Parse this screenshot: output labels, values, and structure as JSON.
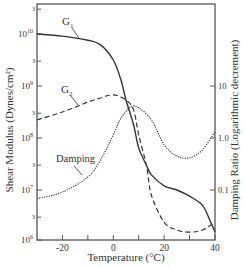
{
  "chart_data": {
    "type": "line",
    "title": "",
    "xlabel": "Temperature (°C)",
    "ylabel": "Shear Modulus (Dynes/cm²)",
    "ylabel_right": "Damping Ratio (Logarithmic decrement)",
    "xlim": [
      -30,
      40
    ],
    "ylim": [
      1000000.0,
      30000000000.0
    ],
    "ylim_right": [
      0.01,
      30
    ],
    "yscale": "log",
    "grid": false,
    "legend": "inline annotations",
    "x_ticks": [
      {
        "value": -20,
        "label": "-20"
      },
      {
        "value": 0,
        "label": "0"
      },
      {
        "value": 20,
        "label": "20"
      },
      {
        "value": 40,
        "label": "40"
      }
    ],
    "x_minor_ticks": [
      -10,
      10,
      30
    ],
    "y_ticks_left": [
      {
        "exp": 10,
        "label_base": "10",
        "label_exp": "10"
      },
      {
        "exp": 9,
        "label_base": "10",
        "label_exp": "9"
      },
      {
        "exp": 8,
        "label_base": "10",
        "label_exp": "8"
      },
      {
        "exp": 7,
        "label_base": "10",
        "label_exp": "7"
      },
      {
        "exp": 6,
        "label_base": "10",
        "label_exp": "6"
      }
    ],
    "y_minor_ticks_left": [
      {
        "exp": 10.477,
        "label": "3"
      },
      {
        "exp": 9.477,
        "label": "3"
      },
      {
        "exp": 8.477,
        "label": "3"
      },
      {
        "exp": 7.477,
        "label": "3"
      },
      {
        "exp": 6.477,
        "label": "3"
      }
    ],
    "y_ticks_right": [
      {
        "value": 10,
        "label": "10"
      },
      {
        "value": 1.0,
        "label": "1.0"
      },
      {
        "value": 0.1,
        "label": "0.1"
      }
    ],
    "series": [
      {
        "name": "G1",
        "label_main": "G",
        "label_sub": "1",
        "axis": "left",
        "style": "solid",
        "x": [
          -30,
          -20,
          -10,
          -5,
          0,
          3,
          5,
          8,
          10,
          13,
          15,
          20,
          25,
          30,
          35,
          38,
          40
        ],
        "log10_values": [
          10.0,
          9.96,
          9.88,
          9.79,
          9.5,
          9.12,
          8.73,
          8.25,
          7.81,
          7.48,
          7.29,
          7.08,
          7.0,
          6.88,
          6.71,
          6.42,
          6.19
        ]
      },
      {
        "name": "G2",
        "label_main": "G",
        "label_sub": "2",
        "axis": "left",
        "style": "dashed",
        "x": [
          -30,
          -20,
          -10,
          -5,
          0,
          5,
          8,
          10,
          13,
          15,
          20,
          25,
          30,
          35,
          40
        ],
        "log10_values": [
          8.35,
          8.5,
          8.69,
          8.77,
          8.83,
          8.73,
          8.54,
          8.06,
          7.48,
          6.9,
          6.38,
          6.23,
          6.19,
          6.23,
          6.38
        ]
      },
      {
        "name": "Damping",
        "label": "Damping",
        "axis": "right",
        "style": "dotted",
        "x": [
          -30,
          -20,
          -10,
          -5,
          0,
          3,
          7,
          10,
          15,
          20,
          25,
          30,
          35,
          40
        ],
        "log10_values": [
          -1.17,
          -1.04,
          -0.75,
          -0.42,
          0.06,
          0.38,
          0.6,
          0.58,
          0.35,
          -0.13,
          -0.35,
          -0.38,
          -0.23,
          0.12
        ]
      }
    ],
    "annotations": [
      {
        "text": "G1",
        "x": -15,
        "y_log10": 10.2
      },
      {
        "text": "G2",
        "x": -17,
        "y_log10": 8.9
      },
      {
        "text": "Damping",
        "x": -17,
        "y_right": 0.22
      }
    ]
  }
}
